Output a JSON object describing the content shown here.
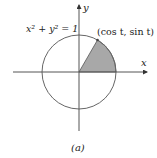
{
  "figure": {
    "equation_label": "x² + y² = 1",
    "point_label": "(cos t, sin t)",
    "x_axis_label": "x",
    "y_axis_label": "y",
    "caption": "(a)"
  },
  "geometry": {
    "center": [
      79,
      72
    ],
    "radius": 37,
    "sector_angle_deg": 60
  },
  "colors": {
    "axis": "#555555",
    "circle": "#666666",
    "sector_fill": "#a8a8a8",
    "text": "#222222"
  }
}
